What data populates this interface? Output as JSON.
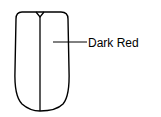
{
  "diagram": {
    "annotations": [
      {
        "label": "Dark Red"
      }
    ],
    "colors": {
      "stroke": "#000000",
      "background": "#ffffff"
    }
  }
}
